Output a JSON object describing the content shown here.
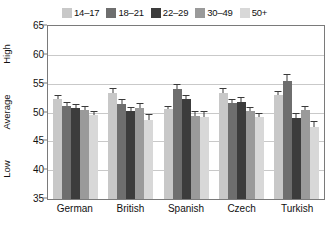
{
  "chart_data": {
    "type": "bar",
    "title": "",
    "xlabel": "",
    "ylabel": "Mean T = score",
    "ylim": [
      35,
      65
    ],
    "yticks": [
      35,
      40,
      45,
      50,
      55,
      60,
      65
    ],
    "grid": true,
    "legend_position": "top",
    "y_anchor_labels": [
      {
        "text": "High",
        "value": 60
      },
      {
        "text": "Average",
        "value": 50
      },
      {
        "text": "Low",
        "value": 40
      }
    ],
    "categories": [
      "German",
      "British",
      "Spanish",
      "Czech",
      "Turkish"
    ],
    "series": [
      {
        "name": "14–17",
        "color": "#c8c8c8",
        "values": [
          52.3,
          53.3,
          50.6,
          53.4,
          53.0
        ],
        "errors": [
          0.7,
          0.9,
          0.6,
          0.8,
          0.8
        ]
      },
      {
        "name": "18–21",
        "color": "#6e6e6e",
        "values": [
          51.2,
          51.5,
          54.1,
          51.7,
          55.5
        ],
        "errors": [
          0.6,
          0.8,
          0.8,
          0.7,
          1.2
        ]
      },
      {
        "name": "22–29",
        "color": "#3c3c3c",
        "values": [
          50.8,
          50.2,
          52.4,
          51.9,
          49.1
        ],
        "errors": [
          0.6,
          0.8,
          0.7,
          0.8,
          0.8
        ]
      },
      {
        "name": "30–49",
        "color": "#9a9a9a",
        "values": [
          50.5,
          50.8,
          49.4,
          50.3,
          50.4
        ],
        "errors": [
          0.6,
          0.9,
          0.8,
          0.7,
          0.8
        ]
      },
      {
        "name": "50+",
        "color": "#d8d8d8",
        "values": [
          49.6,
          48.7,
          49.3,
          49.2,
          47.5
        ],
        "errors": [
          0.7,
          1.0,
          0.9,
          0.8,
          1.1
        ]
      }
    ]
  },
  "legend": {
    "items": [
      {
        "label": "14–17"
      },
      {
        "label": "18–21"
      },
      {
        "label": "22–29"
      },
      {
        "label": "30–49"
      },
      {
        "label": "50+"
      }
    ]
  },
  "axes": {
    "y_title": "Mean T = score",
    "y_high": "High",
    "y_average": "Average",
    "y_low": "Low",
    "tick_65": "65",
    "tick_60": "60",
    "tick_55": "55",
    "tick_50": "50",
    "tick_45": "45",
    "tick_40": "40",
    "tick_35": "35"
  },
  "colors": {
    "grid": "#c9c9c9",
    "frame": "#7a7a7a",
    "error": "#3a3a3a",
    "text": "#111111"
  }
}
